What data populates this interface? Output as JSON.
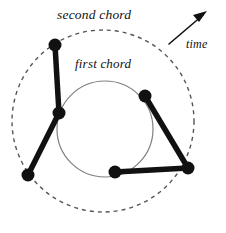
{
  "figure": {
    "title_labels": {
      "second_chord": "second chord",
      "first_chord": "first chord",
      "time": "time"
    },
    "colors": {
      "background": "#ffffff",
      "node_fill": "#111111",
      "chord_stroke": "#111111",
      "inner_circle_stroke": "#808080",
      "outer_circle_stroke": "#555555",
      "arrow_stroke": "#111111",
      "text": "#111111"
    },
    "outer_circle": {
      "name": "second-chord-circle",
      "cx": 103,
      "cy": 121,
      "r": 91,
      "style": "dashed",
      "dash": "4 4",
      "stroke_width": 1.4
    },
    "inner_circle": {
      "name": "first-chord-circle",
      "cx": 105,
      "cy": 129,
      "r": 48,
      "style": "solid",
      "stroke_width": 1.2
    },
    "nodes": [
      {
        "id": "n1",
        "label": "top-left-node",
        "x": 55,
        "y": 45,
        "r": 6.5
      },
      {
        "id": "n2",
        "label": "mid-left-node",
        "x": 59,
        "y": 113,
        "r": 6.5
      },
      {
        "id": "n3",
        "label": "bottom-left-node",
        "x": 28,
        "y": 175,
        "r": 6.5
      },
      {
        "id": "n4",
        "label": "upper-right-node",
        "x": 145,
        "y": 96,
        "r": 6.5
      },
      {
        "id": "n5",
        "label": "right-node",
        "x": 188,
        "y": 168,
        "r": 6.5
      },
      {
        "id": "n6",
        "label": "bottom-mid-node",
        "x": 115,
        "y": 172,
        "r": 6.5
      }
    ],
    "chords": [
      {
        "id": "c1",
        "label": "chord-segment-n1-n2",
        "x1": 55,
        "y1": 45,
        "x2": 59,
        "y2": 113,
        "stroke_width": 5.5
      },
      {
        "id": "c2",
        "label": "chord-segment-n2-n3",
        "x1": 59,
        "y1": 113,
        "x2": 28,
        "y2": 175,
        "stroke_width": 5.5
      },
      {
        "id": "c3",
        "label": "chord-segment-n4-n5",
        "x1": 145,
        "y1": 96,
        "x2": 188,
        "y2": 168,
        "stroke_width": 5.5
      },
      {
        "id": "c4",
        "label": "chord-segment-n5-n6",
        "x1": 188,
        "y1": 168,
        "x2": 115,
        "y2": 172,
        "stroke_width": 5.5
      }
    ],
    "time_arrow": {
      "name": "time-arrow",
      "x1": 169,
      "y1": 44,
      "x2": 206,
      "y2": 12,
      "stroke_width": 1.6
    }
  }
}
